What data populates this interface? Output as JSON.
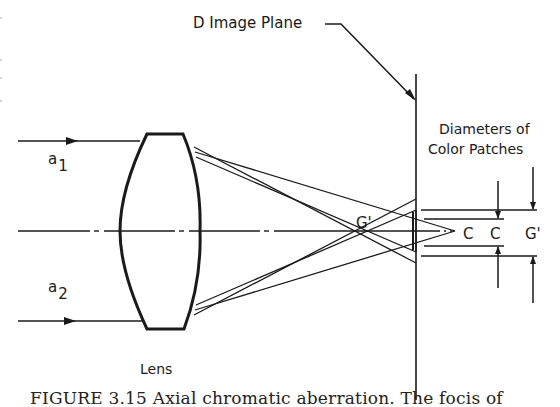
{
  "figure": {
    "title_label": "D Image Plane",
    "diameters_label_line1": "Diameters of",
    "diameters_label_line2": "Color Patches",
    "ray_labels": [
      {
        "base": "a",
        "sub": "1"
      },
      {
        "base": "a",
        "sub": "2"
      }
    ],
    "lens_label": "Lens",
    "focus_labels": {
      "g_prime_focus": "G'",
      "patch_c_inner": "C",
      "patch_c_outer": "C",
      "patch_g_prime": "G'"
    },
    "caption": "FIGURE 3.15   Axial chromatic aberration.  The focis of"
  },
  "colors": {
    "ink": "#1a1a1a",
    "background": "#ffffff"
  }
}
